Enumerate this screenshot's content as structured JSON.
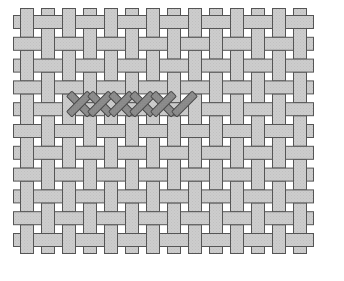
{
  "figure": {
    "alt_label": "woven-fabric-cross-stitch-diagram",
    "background_color": "#ffffff"
  },
  "colors": {
    "thread_fill": "#c9c9c9",
    "thread_fill_light": "#d2d2d2",
    "thread_stroke": "#555555",
    "stitch_fill": "#8a8a8a",
    "stitch_stroke": "#4a4a4a",
    "background": "#ffffff"
  },
  "weave": {
    "type": "plain-weave",
    "warp_count": 14,
    "weft_count": 11,
    "cell_pitch_x": 21.0,
    "cell_pitch_y": 21.8,
    "thread_width": 13,
    "origin_x": 27,
    "origin_y": 22,
    "overshoot": 7,
    "warp_positions": [
      27,
      48,
      69,
      90,
      111,
      132,
      153,
      174,
      195,
      216,
      237,
      258,
      279,
      300
    ],
    "weft_positions": [
      22,
      43.8,
      65.6,
      87.4,
      109.2,
      131,
      152.8,
      174.6,
      196.4,
      218.2,
      240
    ]
  },
  "stitch_row": {
    "label": "cross-stitch-row",
    "row_index": 3,
    "center_y": 104,
    "cell_size": 21,
    "bar_thickness": 7.5,
    "complete_stitch_count": 5,
    "partial_stitch_count": 1,
    "first_cell_x": 69,
    "stitches": [
      {
        "index": 1,
        "x": 69,
        "legs": [
          "backslash",
          "slash"
        ],
        "complete": true
      },
      {
        "index": 2,
        "x": 90,
        "legs": [
          "backslash",
          "slash"
        ],
        "complete": true
      },
      {
        "index": 3,
        "x": 111,
        "legs": [
          "backslash",
          "slash"
        ],
        "complete": true
      },
      {
        "index": 4,
        "x": 132,
        "legs": [
          "backslash",
          "slash"
        ],
        "complete": true
      },
      {
        "index": 5,
        "x": 153,
        "legs": [
          "backslash",
          "slash"
        ],
        "complete": true
      },
      {
        "index": 6,
        "x": 174,
        "legs": [
          "slash"
        ],
        "complete": false
      }
    ]
  }
}
